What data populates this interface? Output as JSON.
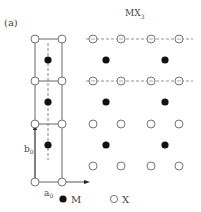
{
  "figure": {
    "panel_label": "(a)",
    "title": "MX",
    "title_subscript": "3",
    "axis_labels": {
      "b": "b",
      "b_sub": "0",
      "a": "a",
      "a_sub": "0"
    },
    "legend": [
      {
        "symbol": "filled-circle",
        "label": "M"
      },
      {
        "symbol": "open-circle",
        "label": "X"
      }
    ],
    "colors": {
      "line": "#555555",
      "filled_atom": "#111111",
      "open_atom_stroke": "#666666"
    }
  }
}
